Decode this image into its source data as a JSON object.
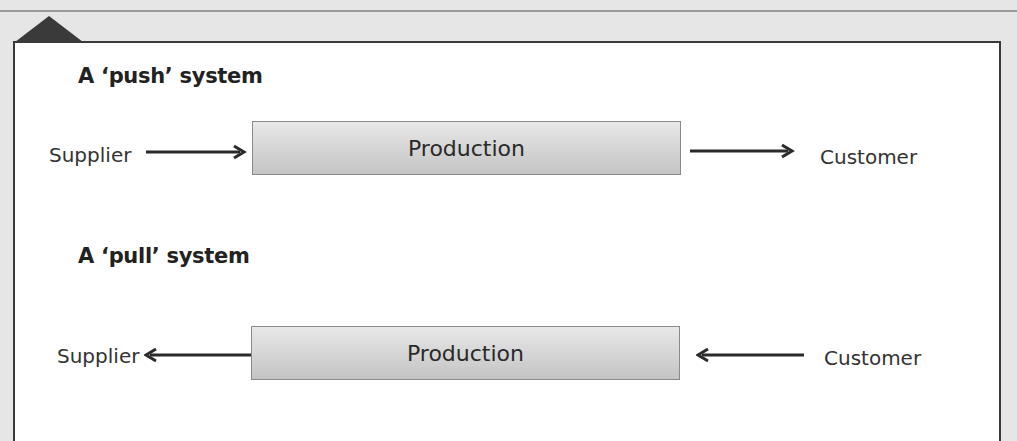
{
  "diagram": {
    "colors": {
      "background": "#e6e6e6",
      "panel": "#ffffff",
      "border": "#3a3a3a",
      "box_fill": "#d6d6d6",
      "arrow": "#2a2a2a"
    },
    "push": {
      "title": "A ‘push’ system",
      "left_label": "Supplier",
      "box_label": "Production",
      "right_label": "Customer",
      "flow": [
        "Supplier → Production",
        "Production → Customer"
      ]
    },
    "pull": {
      "title": "A ‘pull’ system",
      "left_label": "Supplier",
      "box_label": "Production",
      "right_label": "Customer",
      "flow": [
        "Production → Supplier",
        "Customer → Production"
      ]
    }
  }
}
